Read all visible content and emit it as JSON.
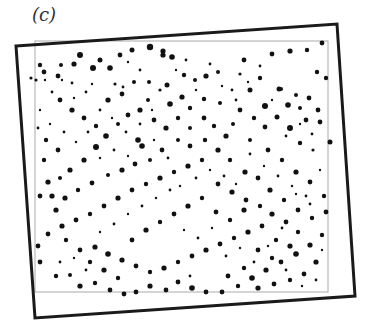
{
  "figure": {
    "panel_label": "(c)",
    "outer_frame": {
      "corners": [
        [
          16,
          46
        ],
        [
          337,
          24
        ],
        [
          355,
          296
        ],
        [
          35,
          318
        ]
      ],
      "stroke": "#1a1a1a",
      "stroke_width": 3
    },
    "inner_frame": {
      "x": 35,
      "y": 41,
      "width": 293,
      "height": 251,
      "stroke": "#aaaaaa"
    },
    "dot_color": "#111111",
    "dots": [
      [
        150,
        47,
        3.2
      ],
      [
        163,
        55,
        2.6
      ],
      [
        163,
        51,
        2.6
      ],
      [
        172,
        57,
        2.8
      ],
      [
        132,
        50,
        2.5
      ],
      [
        40,
        65,
        2.2
      ],
      [
        44,
        72,
        2.4
      ],
      [
        58,
        76,
        2.4
      ],
      [
        74,
        64,
        2.6
      ],
      [
        93,
        68,
        3
      ],
      [
        110,
        68,
        2.8
      ],
      [
        120,
        55,
        2.4
      ],
      [
        80,
        55,
        3
      ],
      [
        100,
        60,
        2.5
      ],
      [
        61,
        65,
        2
      ],
      [
        45,
        80,
        1.2
      ],
      [
        62,
        80,
        1.2
      ],
      [
        72,
        83,
        1.4
      ],
      [
        92,
        84,
        1.2
      ],
      [
        115,
        84,
        1.6
      ],
      [
        123,
        87,
        1.4
      ],
      [
        134,
        82,
        2
      ],
      [
        149,
        82,
        2
      ],
      [
        167,
        85,
        2.5
      ],
      [
        184,
        75,
        2.2
      ],
      [
        195,
        80,
        2
      ],
      [
        206,
        76,
        2.6
      ],
      [
        218,
        72,
        2
      ],
      [
        244,
        60,
        2.4
      ],
      [
        272,
        54,
        2.4
      ],
      [
        290,
        51,
        2.6
      ],
      [
        307,
        50,
        2.2
      ],
      [
        322,
        43,
        2.4
      ],
      [
        317,
        72,
        2.2
      ],
      [
        326,
        78,
        2.2
      ],
      [
        318,
        110,
        2.4
      ],
      [
        309,
        98,
        2.4
      ],
      [
        296,
        95,
        2
      ],
      [
        281,
        89,
        2
      ],
      [
        260,
        78,
        2.2
      ],
      [
        240,
        74,
        1.6
      ],
      [
        232,
        90,
        1.4
      ],
      [
        250,
        90,
        2.5
      ],
      [
        265,
        106,
        3
      ],
      [
        279,
        89,
        2.5
      ],
      [
        288,
        105,
        2.8
      ],
      [
        300,
        108,
        2
      ],
      [
        306,
        120,
        2.4
      ],
      [
        320,
        122,
        2.4
      ],
      [
        330,
        142,
        2.5
      ],
      [
        313,
        150,
        1.6
      ],
      [
        300,
        143,
        2.2
      ],
      [
        290,
        128,
        3
      ],
      [
        277,
        117,
        2.5
      ],
      [
        265,
        127,
        2.4
      ],
      [
        250,
        140,
        2
      ],
      [
        233,
        124,
        2
      ],
      [
        220,
        103,
        2
      ],
      [
        204,
        99,
        2.2
      ],
      [
        190,
        108,
        2.2
      ],
      [
        182,
        97,
        2.6
      ],
      [
        170,
        104,
        2.8
      ],
      [
        160,
        90,
        1.6
      ],
      [
        148,
        100,
        2
      ],
      [
        140,
        110,
        2.6
      ],
      [
        128,
        115,
        2.4
      ],
      [
        118,
        124,
        2
      ],
      [
        106,
        136,
        2.8
      ],
      [
        96,
        147,
        3
      ],
      [
        84,
        160,
        2.6
      ],
      [
        70,
        170,
        2.6
      ],
      [
        60,
        178,
        2
      ],
      [
        48,
        182,
        2.6
      ],
      [
        40,
        196,
        2.4
      ],
      [
        52,
        196,
        2.6
      ],
      [
        65,
        198,
        2.6
      ],
      [
        78,
        190,
        2.2
      ],
      [
        92,
        183,
        2.4
      ],
      [
        108,
        175,
        2
      ],
      [
        122,
        170,
        2.6
      ],
      [
        135,
        164,
        2.4
      ],
      [
        150,
        160,
        2
      ],
      [
        162,
        150,
        2.4
      ],
      [
        178,
        140,
        2
      ],
      [
        190,
        128,
        2
      ],
      [
        205,
        140,
        2.2
      ],
      [
        218,
        150,
        2.6
      ],
      [
        230,
        160,
        2.2
      ],
      [
        245,
        172,
        2.6
      ],
      [
        258,
        178,
        2.4
      ],
      [
        270,
        190,
        2.6
      ],
      [
        284,
        200,
        2.2
      ],
      [
        298,
        210,
        2.4
      ],
      [
        312,
        218,
        2.2
      ],
      [
        322,
        235,
        2.2
      ],
      [
        310,
        245,
        2.6
      ],
      [
        296,
        254,
        2.8
      ],
      [
        281,
        262,
        2.4
      ],
      [
        266,
        270,
        2.6
      ],
      [
        252,
        278,
        2.8
      ],
      [
        238,
        286,
        2.2
      ],
      [
        222,
        292,
        2.4
      ],
      [
        206,
        292,
        2.4
      ],
      [
        192,
        288,
        2.8
      ],
      [
        178,
        282,
        2.4
      ],
      [
        166,
        290,
        2.4
      ],
      [
        150,
        286,
        2.6
      ],
      [
        136,
        292,
        2.4
      ],
      [
        124,
        294,
        2.4
      ],
      [
        110,
        290,
        2.4
      ],
      [
        95,
        283,
        2.2
      ],
      [
        80,
        286,
        2.6
      ],
      [
        70,
        275,
        2
      ],
      [
        56,
        276,
        2.2
      ],
      [
        40,
        262,
        2.4
      ],
      [
        38,
        246,
        2.4
      ],
      [
        48,
        234,
        2.4
      ],
      [
        62,
        226,
        2.6
      ],
      [
        76,
        220,
        2.4
      ],
      [
        90,
        214,
        2.2
      ],
      [
        104,
        206,
        2.4
      ],
      [
        118,
        198,
        2.6
      ],
      [
        132,
        190,
        2.4
      ],
      [
        146,
        184,
        2.2
      ],
      [
        160,
        178,
        2.6
      ],
      [
        174,
        172,
        2.2
      ],
      [
        188,
        166,
        2.6
      ],
      [
        202,
        160,
        2.2
      ],
      [
        218,
        184,
        2.4
      ],
      [
        232,
        192,
        2.6
      ],
      [
        246,
        200,
        2.4
      ],
      [
        260,
        206,
        2.2
      ],
      [
        272,
        214,
        2.6
      ],
      [
        286,
        222,
        2.4
      ],
      [
        298,
        232,
        2.2
      ],
      [
        95,
        247,
        2.6
      ],
      [
        108,
        254,
        2.8
      ],
      [
        122,
        260,
        2.6
      ],
      [
        136,
        266,
        2.4
      ],
      [
        150,
        272,
        2.2
      ],
      [
        164,
        268,
        2.6
      ],
      [
        178,
        262,
        2.2
      ],
      [
        192,
        256,
        2.4
      ],
      [
        206,
        250,
        2.6
      ],
      [
        220,
        244,
        2.4
      ],
      [
        234,
        238,
        2.2
      ],
      [
        248,
        232,
        2.6
      ],
      [
        262,
        226,
        2.4
      ],
      [
        276,
        240,
        2.2
      ],
      [
        290,
        246,
        2.6
      ],
      [
        60,
        100,
        2.4
      ],
      [
        72,
        110,
        2.6
      ],
      [
        84,
        118,
        2.4
      ],
      [
        96,
        126,
        2.2
      ],
      [
        108,
        100,
        2.6
      ],
      [
        122,
        94,
        2.4
      ],
      [
        138,
        140,
        2.8
      ],
      [
        142,
        146,
        2.8
      ],
      [
        154,
        120,
        2.4
      ],
      [
        166,
        128,
        2.6
      ],
      [
        178,
        118,
        2.2
      ],
      [
        190,
        146,
        2.4
      ],
      [
        204,
        118,
        2.4
      ],
      [
        214,
        126,
        2.2
      ],
      [
        226,
        136,
        2.6
      ],
      [
        240,
        110,
        2.4
      ],
      [
        254,
        118,
        2.2
      ],
      [
        268,
        150,
        2.4
      ],
      [
        282,
        160,
        2.2
      ],
      [
        296,
        172,
        2.6
      ],
      [
        310,
        182,
        2.4
      ],
      [
        324,
        196,
        2.2
      ],
      [
        326,
        212,
        2.4
      ],
      [
        316,
        262,
        2.6
      ],
      [
        304,
        274,
        2.4
      ],
      [
        290,
        280,
        2.2
      ],
      [
        274,
        284,
        2.4
      ],
      [
        258,
        288,
        2.6
      ],
      [
        244,
        268,
        2.2
      ],
      [
        228,
        276,
        2.4
      ],
      [
        46,
        140,
        2.2
      ],
      [
        58,
        150,
        2.4
      ],
      [
        44,
        160,
        2.2
      ],
      [
        56,
        210,
        2.6
      ],
      [
        66,
        240,
        2.2
      ],
      [
        80,
        250,
        2.4
      ],
      [
        90,
        262,
        2.2
      ],
      [
        104,
        270,
        2.6
      ],
      [
        118,
        278,
        2.2
      ],
      [
        132,
        240,
        2.4
      ],
      [
        146,
        230,
        2.6
      ],
      [
        160,
        222,
        2.2
      ],
      [
        174,
        214,
        2.4
      ],
      [
        188,
        206,
        2.6
      ],
      [
        202,
        198,
        2.2
      ],
      [
        216,
        212,
        2.4
      ],
      [
        230,
        220,
        2.2
      ],
      [
        244,
        210,
        2.6
      ],
      [
        258,
        250,
        2.4
      ],
      [
        272,
        258,
        2.2
      ],
      [
        100,
        110,
        1.4
      ],
      [
        112,
        118,
        1.2
      ],
      [
        126,
        132,
        1.4
      ],
      [
        154,
        140,
        1.2
      ],
      [
        168,
        158,
        1.4
      ],
      [
        180,
        186,
        1.2
      ],
      [
        196,
        178,
        1.4
      ],
      [
        210,
        170,
        1.2
      ],
      [
        224,
        176,
        1.4
      ],
      [
        236,
        184,
        1.2
      ],
      [
        250,
        154,
        1.4
      ],
      [
        264,
        166,
        1.2
      ],
      [
        278,
        176,
        1.4
      ],
      [
        292,
        186,
        1.2
      ],
      [
        306,
        196,
        1.4
      ],
      [
        320,
        170,
        1.2
      ],
      [
        312,
        134,
        1.4
      ],
      [
        300,
        124,
        1.2
      ],
      [
        286,
        136,
        1.4
      ],
      [
        272,
        100,
        1.2
      ],
      [
        260,
        66,
        1.4
      ],
      [
        248,
        82,
        1.2
      ],
      [
        236,
        100,
        1.4
      ],
      [
        222,
        86,
        1.2
      ],
      [
        210,
        64,
        1.4
      ],
      [
        196,
        90,
        1.2
      ],
      [
        186,
        60,
        1.4
      ],
      [
        176,
        70,
        1.2
      ],
      [
        140,
        70,
        1.4
      ],
      [
        128,
        62,
        1.2
      ],
      [
        86,
        92,
        1.4
      ],
      [
        74,
        98,
        1.2
      ],
      [
        52,
        92,
        1.4
      ],
      [
        40,
        110,
        1.2
      ],
      [
        38,
        128,
        1.4
      ],
      [
        50,
        124,
        1.2
      ],
      [
        64,
        132,
        1.4
      ],
      [
        76,
        142,
        1.2
      ],
      [
        88,
        132,
        1.4
      ],
      [
        100,
        158,
        1.2
      ],
      [
        114,
        150,
        1.4
      ],
      [
        128,
        156,
        1.2
      ],
      [
        140,
        124,
        1.4
      ],
      [
        152,
        110,
        1.2
      ],
      [
        60,
        262,
        1.4
      ],
      [
        74,
        258,
        1.2
      ],
      [
        86,
        270,
        1.4
      ],
      [
        100,
        232,
        1.2
      ],
      [
        114,
        224,
        1.4
      ],
      [
        128,
        214,
        1.2
      ],
      [
        142,
        206,
        1.4
      ],
      [
        156,
        198,
        1.2
      ],
      [
        170,
        190,
        1.4
      ],
      [
        184,
        230,
        1.2
      ],
      [
        198,
        238,
        1.4
      ],
      [
        212,
        228,
        1.2
      ],
      [
        226,
        256,
        1.4
      ],
      [
        240,
        248,
        1.2
      ],
      [
        254,
        262,
        1.4
      ],
      [
        268,
        246,
        1.2
      ],
      [
        282,
        228,
        1.4
      ],
      [
        296,
        194,
        1.2
      ],
      [
        310,
        204,
        1.4
      ],
      [
        322,
        250,
        1.2
      ],
      [
        316,
        280,
        1.4
      ],
      [
        302,
        286,
        1.2
      ],
      [
        286,
        270,
        1.4
      ],
      [
        36,
        80,
        1.6
      ],
      [
        31,
        78,
        1.6
      ],
      [
        190,
        276,
        1.4
      ]
    ]
  }
}
